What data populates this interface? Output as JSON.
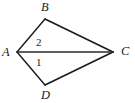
{
  "figure": {
    "type": "geometry-diagram",
    "background_color": "#ffffff",
    "stroke_color": "#1a1a1a",
    "vertices": [
      {
        "id": "A",
        "label": "A",
        "x": 17,
        "y": 52
      },
      {
        "id": "B",
        "label": "B",
        "x": 45,
        "y": 19
      },
      {
        "id": "C",
        "label": "C",
        "x": 113,
        "y": 52
      },
      {
        "id": "D",
        "label": "D",
        "x": 45,
        "y": 85
      }
    ],
    "edges": [
      {
        "id": "AB",
        "from": "A",
        "to": "B",
        "width": 1.4
      },
      {
        "id": "BC",
        "from": "B",
        "to": "C",
        "width": 1.6
      },
      {
        "id": "AC",
        "from": "A",
        "to": "C",
        "width": 1.6
      },
      {
        "id": "AD",
        "from": "A",
        "to": "D",
        "width": 1.4
      },
      {
        "id": "DC",
        "from": "D",
        "to": "C",
        "width": 1.6
      }
    ],
    "vertex_labels": {
      "A": "A",
      "B": "B",
      "C": "C",
      "D": "D"
    },
    "angle_labels": {
      "upper": "2",
      "lower": "1"
    }
  }
}
